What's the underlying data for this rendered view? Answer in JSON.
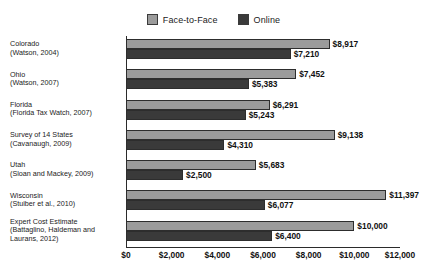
{
  "chart_data": {
    "type": "bar",
    "orientation": "horizontal",
    "title": "",
    "subtitle": "",
    "xlabel": "",
    "ylabel": "",
    "xlim": [
      0,
      12000
    ],
    "xticks": [
      "$0",
      "$2,000",
      "$4,000",
      "$6,000",
      "$8,000",
      "$10,000",
      "$12,000"
    ],
    "xtick_values": [
      0,
      2000,
      4000,
      6000,
      8000,
      10000,
      12000
    ],
    "grid": false,
    "legend_position": "top-center",
    "legend": [
      "Face-to-Face",
      "Online"
    ],
    "categories": [
      "Colorado (Watson, 2004)",
      "Ohio (Watson, 2007)",
      "Florida (Florida Tax Watch, 2007)",
      "Survey of 14 States (Cavanaugh, 2009)",
      "Utah (Sloan and Mackey, 2009)",
      "Wisconsin (Stuiber et al., 2010)",
      "Expert Cost Estimate (Battaglino, Haldeman and Laurans, 2012)"
    ],
    "series": [
      {
        "name": "Face-to-Face",
        "color": "#9b9b9b",
        "values": [
          8917,
          7452,
          6291,
          9138,
          5683,
          11397,
          10000
        ],
        "data_labels": [
          "$8,917",
          "$7,452",
          "$6,291",
          "$9,138",
          "$5,683",
          "$11,397",
          "$10,000"
        ]
      },
      {
        "name": "Online",
        "color": "#3a3a3a",
        "values": [
          7210,
          5383,
          5243,
          4310,
          2500,
          6077,
          6400
        ],
        "data_labels": [
          "$7,210",
          "$5,383",
          "$5,243",
          "$4,310",
          "$2,500",
          "$6,077",
          "$6,400"
        ]
      }
    ]
  },
  "category_labels": [
    {
      "name": "Colorado",
      "source": "(Watson, 2004)",
      "source2": ""
    },
    {
      "name": "Ohio",
      "source": "(Watson, 2007)",
      "source2": ""
    },
    {
      "name": "Florida",
      "source": "(Florida Tax Watch, 2007)",
      "source2": ""
    },
    {
      "name": "Survey of 14 States",
      "source": "(Cavanaugh, 2009)",
      "source2": ""
    },
    {
      "name": "Utah",
      "source": "(Sloan and Mackey, 2009)",
      "source2": ""
    },
    {
      "name": "Wisconsin",
      "source": "(Stuiber et al., 2010)",
      "source2": ""
    },
    {
      "name": "Expert Cost Estimate",
      "source": "(Battaglino, Haldeman and",
      "source2": "Laurans, 2012)"
    }
  ],
  "colors": {
    "face_to_face": "#9b9b9b",
    "online": "#3a3a3a",
    "axis": "#2b2b2b",
    "text": "#1b1b1b",
    "background": "#ffffff"
  }
}
